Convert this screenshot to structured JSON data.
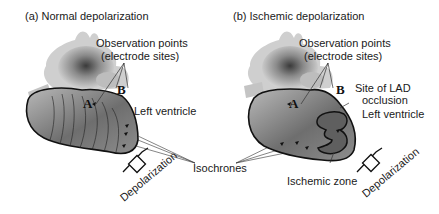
{
  "panels": [
    {
      "id": "a",
      "title": "(a) Normal depolarization",
      "labels": {
        "observation_points": "Observation points",
        "electrode_sites": "(electrode sites)",
        "point_a": "A",
        "point_b": "B",
        "left_ventricle": "Left ventricle",
        "depolarization": "Depolarization"
      }
    },
    {
      "id": "b",
      "title": "(b) Ischemic depolarization",
      "labels": {
        "observation_points": "Observation points",
        "electrode_sites": "(electrode sites)",
        "point_a": "A",
        "point_b": "B",
        "site_of_lad": "Site of LAD",
        "occlusion": "occlusion",
        "left_ventricle": "Left ventricle",
        "ischemic_zone": "Ischemic zone",
        "depolarization": "Depolarization"
      }
    }
  ],
  "shared": {
    "isochrones": "Isochrones"
  },
  "colors": {
    "outline": "#111111",
    "heart_light": "#d9d9d9",
    "heart_dark": "#5a5a5a",
    "text": "#1a1a1a"
  }
}
